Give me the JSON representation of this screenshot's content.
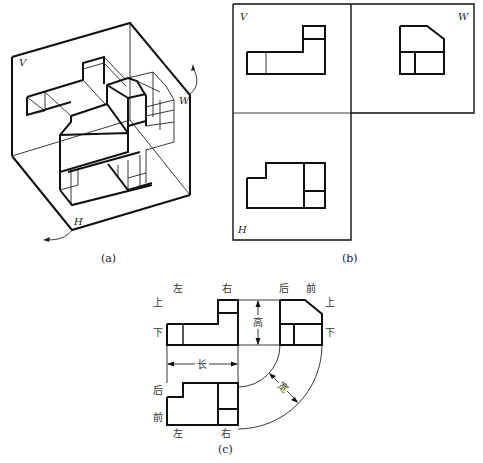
{
  "figure": {
    "panels": [
      {
        "id": "a",
        "caption": "(a)",
        "planes": {
          "V": "V",
          "W": "W",
          "H": "H"
        }
      },
      {
        "id": "b",
        "caption": "(b)",
        "planes": {
          "V": "V",
          "W": "W",
          "H": "H"
        }
      },
      {
        "id": "c",
        "caption": "(c)"
      }
    ],
    "panel_c_labels": {
      "front_view": {
        "left": "左",
        "right": "右",
        "top": "上",
        "bottom": "下"
      },
      "side_view": {
        "back": "后",
        "front": "前",
        "top": "上",
        "bottom": "下"
      },
      "top_view": {
        "back": "后",
        "front": "前",
        "left": "左",
        "right": "右"
      },
      "dimensions": {
        "height": "高",
        "length": "长",
        "width": "宽"
      }
    }
  }
}
